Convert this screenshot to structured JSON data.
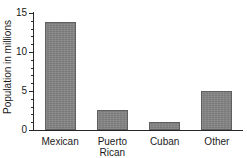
{
  "chart_data": {
    "type": "bar",
    "title": "",
    "xlabel": "",
    "ylabel": "Population in millions",
    "categories": [
      "Mexican",
      "Puerto Rican",
      "Cuban",
      "Other"
    ],
    "category_labels_display": [
      "Mexican",
      "Puerto\nRican",
      "Cuban",
      "Other"
    ],
    "values": [
      13.8,
      2.6,
      1.0,
      5.0
    ],
    "ylim": [
      0,
      15
    ],
    "yticks": [
      0,
      5,
      10,
      15
    ],
    "ytick_labels": [
      "0",
      "5",
      "10",
      "15"
    ],
    "minor_tick_interval": 1,
    "grid": false,
    "legend": false,
    "bar_color": "#848484",
    "bar_edge_color": "#5f5f5f",
    "axis_color": "#262626",
    "text_color": "#1a1a1a",
    "background": "#ffffff"
  }
}
